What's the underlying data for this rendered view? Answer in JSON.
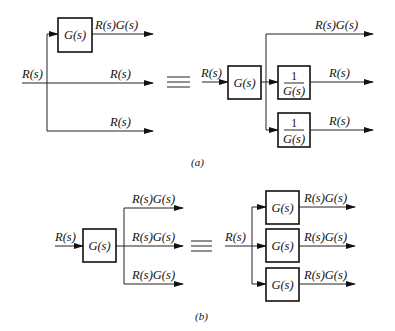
{
  "diagram": {
    "a": {
      "caption": "(a)",
      "left": {
        "input": "R(s)",
        "block": "G(s)",
        "outputs": [
          "R(s)G(s)",
          "R(s)",
          "R(s)"
        ]
      },
      "equiv": "≡",
      "right": {
        "input": "R(s)",
        "block": "G(s)",
        "inverse_blocks": [
          {
            "num": "1",
            "den": "G(s)"
          },
          {
            "num": "1",
            "den": "G(s)"
          }
        ],
        "outputs": [
          "R(s)G(s)",
          "R(s)",
          "R(s)"
        ]
      }
    },
    "b": {
      "caption": "(b)",
      "left": {
        "input": "R(s)",
        "block": "G(s)",
        "outputs": [
          "R(s)G(s)",
          "R(s)G(s)",
          "R(s)G(s)"
        ]
      },
      "equiv": "≡",
      "right": {
        "input": "R(s)",
        "blocks": [
          "G(s)",
          "G(s)",
          "G(s)"
        ],
        "outputs": [
          "R(s)G(s)",
          "R(s)G(s)",
          "R(s)G(s)"
        ]
      }
    }
  }
}
